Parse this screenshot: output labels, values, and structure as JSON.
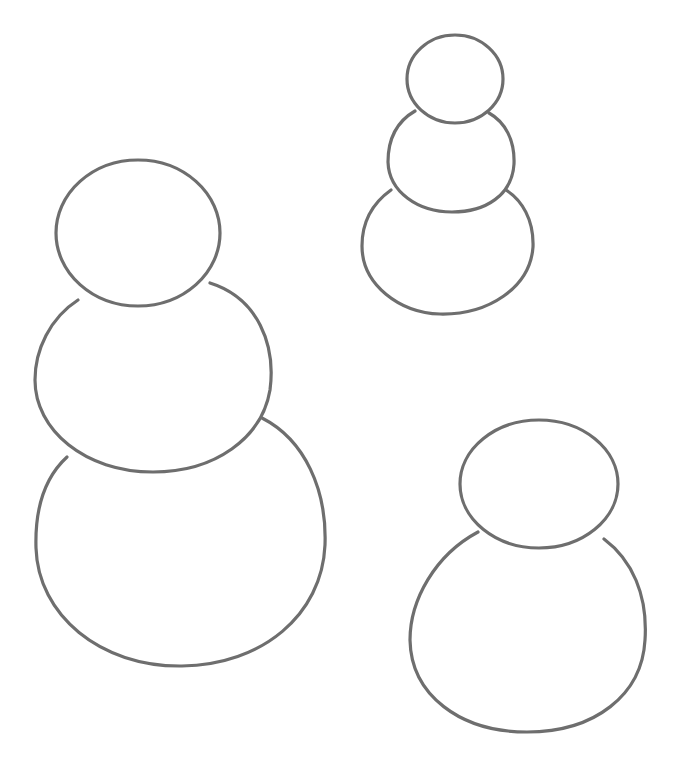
{
  "colors": {
    "background": "#ffffff",
    "stroke": "#6e6e6e"
  },
  "figures": [
    {
      "name": "snowman-large-left",
      "balls": [
        "head",
        "middle",
        "bottom"
      ]
    },
    {
      "name": "snowman-small-top-right",
      "balls": [
        "head",
        "middle",
        "bottom"
      ]
    },
    {
      "name": "snowman-two-ball-bottom-right",
      "balls": [
        "head",
        "bottom"
      ]
    }
  ]
}
